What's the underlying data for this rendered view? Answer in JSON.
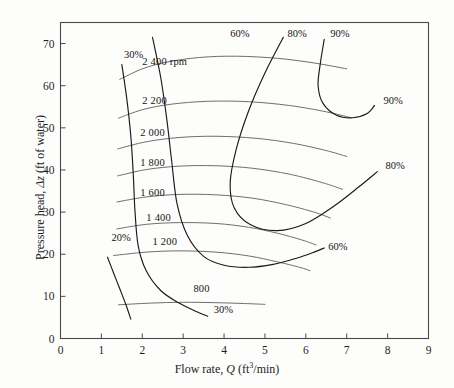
{
  "axes": {
    "x_title_pre": "Flow rate, ",
    "x_title_sym": "Q",
    "x_title_unit_a": " (ft",
    "x_title_unit_sup": "3",
    "x_title_unit_b": "/min)",
    "y_title_pre": "Pressure head, ",
    "y_title_sym": "Δz",
    "y_title_unit": " (ft of water)",
    "x_ticks": [
      "0",
      "1",
      "2",
      "3",
      "4",
      "5",
      "6",
      "7",
      "8",
      "9"
    ],
    "y_ticks": [
      "0",
      "10",
      "20",
      "30",
      "40",
      "50",
      "60",
      "70"
    ],
    "xlim": [
      0,
      9
    ],
    "ylim": [
      0,
      75
    ],
    "frame_color": "#4a4a4a",
    "speed_curve_color": "#6e6e6e",
    "efficiency_curve_color": "#1a1a1a"
  },
  "speed_labels": [
    {
      "text": "2 400 rpm",
      "x": 2.0,
      "y": 65.5
    },
    {
      "text": "2 200",
      "x": 2.0,
      "y": 56.2
    },
    {
      "text": "2 000",
      "x": 1.95,
      "y": 48.6
    },
    {
      "text": "1 800",
      "x": 1.95,
      "y": 41.3
    },
    {
      "text": "1 600",
      "x": 1.95,
      "y": 34.3
    },
    {
      "text": "1 400",
      "x": 2.1,
      "y": 28.4
    },
    {
      "text": "1 200",
      "x": 2.25,
      "y": 22.7
    },
    {
      "text": "800",
      "x": 3.25,
      "y": 11.6
    }
  ],
  "efficiency_labels": [
    {
      "text": "30%",
      "x": 1.55,
      "y": 67.0
    },
    {
      "text": "60%",
      "x": 4.15,
      "y": 72.0
    },
    {
      "text": "80%",
      "x": 5.55,
      "y": 72.0
    },
    {
      "text": "90%",
      "x": 6.6,
      "y": 72.0
    },
    {
      "text": "90%",
      "x": 7.9,
      "y": 56.2
    },
    {
      "text": "80%",
      "x": 7.95,
      "y": 40.6
    },
    {
      "text": "60%",
      "x": 6.55,
      "y": 21.5
    },
    {
      "text": "20%",
      "x": 1.25,
      "y": 23.6
    },
    {
      "text": "30%",
      "x": 3.75,
      "y": 6.6
    }
  ],
  "chart_data": {
    "type": "line",
    "title": "",
    "xlabel": "Flow rate, Q (ft3/min)",
    "ylabel": "Pressure head, Δz (ft of water)",
    "xlim": [
      0,
      9
    ],
    "ylim": [
      0,
      75
    ],
    "grid": false,
    "legend": "inline curve labels",
    "series": [
      {
        "name": "2 400 rpm",
        "kind": "pump-head-curve",
        "points": [
          [
            1.45,
            61.5
          ],
          [
            2.0,
            64.0
          ],
          [
            2.6,
            65.6
          ],
          [
            3.4,
            66.7
          ],
          [
            4.3,
            67.0
          ],
          [
            5.3,
            66.5
          ],
          [
            6.2,
            65.4
          ],
          [
            7.0,
            64.0
          ]
        ]
      },
      {
        "name": "2 200",
        "kind": "pump-head-curve",
        "points": [
          [
            1.42,
            52.3
          ],
          [
            2.0,
            54.3
          ],
          [
            2.7,
            55.6
          ],
          [
            3.6,
            56.3
          ],
          [
            4.6,
            56.2
          ],
          [
            5.6,
            55.3
          ],
          [
            6.5,
            53.8
          ],
          [
            7.1,
            52.4
          ]
        ]
      },
      {
        "name": "2 000",
        "kind": "pump-head-curve",
        "points": [
          [
            1.4,
            45.0
          ],
          [
            2.1,
            46.7
          ],
          [
            2.9,
            47.7
          ],
          [
            3.8,
            48.0
          ],
          [
            4.8,
            47.5
          ],
          [
            5.7,
            46.3
          ],
          [
            6.5,
            44.6
          ],
          [
            7.0,
            43.2
          ]
        ]
      },
      {
        "name": "1 800",
        "kind": "pump-head-curve",
        "points": [
          [
            1.4,
            38.6
          ],
          [
            2.1,
            40.1
          ],
          [
            2.9,
            40.9
          ],
          [
            3.8,
            41.0
          ],
          [
            4.7,
            40.4
          ],
          [
            5.6,
            39.0
          ],
          [
            6.4,
            37.0
          ],
          [
            6.9,
            35.4
          ]
        ]
      },
      {
        "name": "1 600",
        "kind": "pump-head-curve",
        "points": [
          [
            1.38,
            32.4
          ],
          [
            2.1,
            33.6
          ],
          [
            2.9,
            34.2
          ],
          [
            3.8,
            34.1
          ],
          [
            4.7,
            33.3
          ],
          [
            5.5,
            31.8
          ],
          [
            6.2,
            30.0
          ],
          [
            6.6,
            28.6
          ]
        ]
      },
      {
        "name": "1 400",
        "kind": "pump-head-curve",
        "points": [
          [
            1.38,
            26.0
          ],
          [
            2.1,
            27.1
          ],
          [
            2.9,
            27.5
          ],
          [
            3.8,
            27.3
          ],
          [
            4.6,
            26.4
          ],
          [
            5.3,
            25.0
          ],
          [
            5.9,
            23.4
          ],
          [
            6.25,
            22.2
          ]
        ]
      },
      {
        "name": "1 200",
        "kind": "pump-head-curve",
        "points": [
          [
            1.3,
            19.7
          ],
          [
            2.1,
            20.5
          ],
          [
            2.9,
            20.8
          ],
          [
            3.8,
            20.5
          ],
          [
            4.6,
            19.6
          ],
          [
            5.3,
            18.2
          ],
          [
            5.85,
            16.9
          ],
          [
            6.1,
            16.1
          ]
        ]
      },
      {
        "name": "800",
        "kind": "pump-head-curve",
        "points": [
          [
            1.42,
            8.0
          ],
          [
            2.2,
            8.4
          ],
          [
            3.0,
            8.6
          ],
          [
            3.8,
            8.5
          ],
          [
            4.5,
            8.3
          ],
          [
            5.0,
            8.1
          ]
        ]
      },
      {
        "name": "20%",
        "kind": "efficiency-contour",
        "points": [
          [
            1.15,
            19.3
          ],
          [
            1.3,
            15.5
          ],
          [
            1.45,
            11.8
          ],
          [
            1.6,
            8.0
          ],
          [
            1.72,
            4.6
          ]
        ]
      },
      {
        "name": "30%",
        "kind": "efficiency-contour",
        "points": [
          [
            1.5,
            65.0
          ],
          [
            1.62,
            57.0
          ],
          [
            1.72,
            48.0
          ],
          [
            1.78,
            39.0
          ],
          [
            1.82,
            30.5
          ],
          [
            1.9,
            22.0
          ],
          [
            2.1,
            16.0
          ],
          [
            2.45,
            11.4
          ],
          [
            2.9,
            8.4
          ],
          [
            3.35,
            6.3
          ],
          [
            3.6,
            5.3
          ]
        ]
      },
      {
        "name": "60%",
        "kind": "efficiency-contour",
        "points": [
          [
            2.25,
            71.5
          ],
          [
            2.45,
            62.0
          ],
          [
            2.6,
            52.0
          ],
          [
            2.72,
            42.0
          ],
          [
            2.85,
            32.0
          ],
          [
            3.1,
            24.5
          ],
          [
            3.5,
            19.5
          ],
          [
            4.0,
            17.4
          ],
          [
            4.6,
            16.9
          ],
          [
            5.2,
            17.6
          ],
          [
            5.75,
            19.0
          ],
          [
            6.2,
            20.5
          ],
          [
            6.45,
            21.5
          ]
        ]
      },
      {
        "name": "80%",
        "kind": "efficiency-contour",
        "points": [
          [
            5.45,
            71.5
          ],
          [
            5.0,
            63.0
          ],
          [
            4.6,
            54.0
          ],
          [
            4.3,
            45.0
          ],
          [
            4.15,
            37.0
          ],
          [
            4.25,
            31.0
          ],
          [
            4.65,
            27.0
          ],
          [
            5.3,
            25.6
          ],
          [
            6.0,
            27.3
          ],
          [
            6.7,
            31.5
          ],
          [
            7.3,
            36.0
          ],
          [
            7.75,
            39.6
          ]
        ]
      },
      {
        "name": "90%",
        "kind": "efficiency-contour",
        "points": [
          [
            6.45,
            71.0
          ],
          [
            6.35,
            65.0
          ],
          [
            6.3,
            60.0
          ],
          [
            6.42,
            55.8
          ],
          [
            6.75,
            53.0
          ],
          [
            7.15,
            52.4
          ],
          [
            7.5,
            53.4
          ],
          [
            7.68,
            55.3
          ]
        ]
      }
    ]
  }
}
